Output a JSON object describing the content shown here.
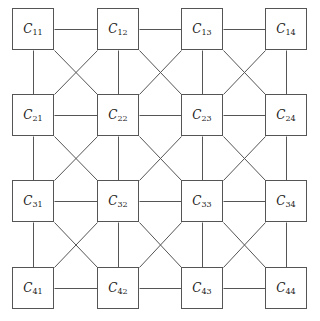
{
  "diagram": {
    "type": "cellular-grid",
    "rows": 4,
    "cols": 4,
    "line_color": "#555555",
    "node_symbol": "C",
    "cell_size": 42,
    "col_x": [
      12,
      97,
      181,
      265
    ],
    "row_y": [
      8,
      94,
      180,
      267
    ],
    "nodes": [
      {
        "row": 1,
        "col": 1,
        "symbol": "C",
        "sub": "11"
      },
      {
        "row": 1,
        "col": 2,
        "symbol": "C",
        "sub": "12"
      },
      {
        "row": 1,
        "col": 3,
        "symbol": "C",
        "sub": "13"
      },
      {
        "row": 1,
        "col": 4,
        "symbol": "C",
        "sub": "14"
      },
      {
        "row": 2,
        "col": 1,
        "symbol": "C",
        "sub": "21"
      },
      {
        "row": 2,
        "col": 2,
        "symbol": "C",
        "sub": "22"
      },
      {
        "row": 2,
        "col": 3,
        "symbol": "C",
        "sub": "23"
      },
      {
        "row": 2,
        "col": 4,
        "symbol": "C",
        "sub": "24"
      },
      {
        "row": 3,
        "col": 1,
        "symbol": "C",
        "sub": "31"
      },
      {
        "row": 3,
        "col": 2,
        "symbol": "C",
        "sub": "32"
      },
      {
        "row": 3,
        "col": 3,
        "symbol": "C",
        "sub": "33"
      },
      {
        "row": 3,
        "col": 4,
        "symbol": "C",
        "sub": "34"
      },
      {
        "row": 4,
        "col": 1,
        "symbol": "C",
        "sub": "41"
      },
      {
        "row": 4,
        "col": 2,
        "symbol": "C",
        "sub": "42"
      },
      {
        "row": 4,
        "col": 3,
        "symbol": "C",
        "sub": "43"
      },
      {
        "row": 4,
        "col": 4,
        "symbol": "C",
        "sub": "44"
      }
    ],
    "connectivity": [
      "horizontal",
      "vertical",
      "diagonal"
    ]
  }
}
